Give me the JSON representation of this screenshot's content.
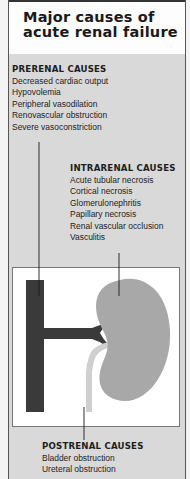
{
  "title": "Major causes of acute renal failure",
  "prerenal": {
    "header": "PRERENAL CAUSES",
    "items": [
      "Decreased cardiac output",
      "Hypovolemia",
      "Peripheral vasodilation",
      "Renovascular obstruction",
      "Severe vasoconstriction"
    ]
  },
  "intrarenal": {
    "header": "INTRARENAL CAUSES",
    "items": [
      "Acute tubular necrosis",
      "Cortical necrosis",
      "Glomerulonephritis",
      "Papillary necrosis",
      "Renal vascular occlusion",
      "Vasculitis"
    ]
  },
  "postrenal": {
    "header": "POSTRENAL CAUSES",
    "items": [
      "Bladder obstruction",
      "Ureteral obstruction"
    ]
  },
  "colors": {
    "aorta": "#3a3a3a",
    "kidney": "#a8a8a8",
    "ureter": "#cfcfcf",
    "panel": "#d9d9d9"
  }
}
